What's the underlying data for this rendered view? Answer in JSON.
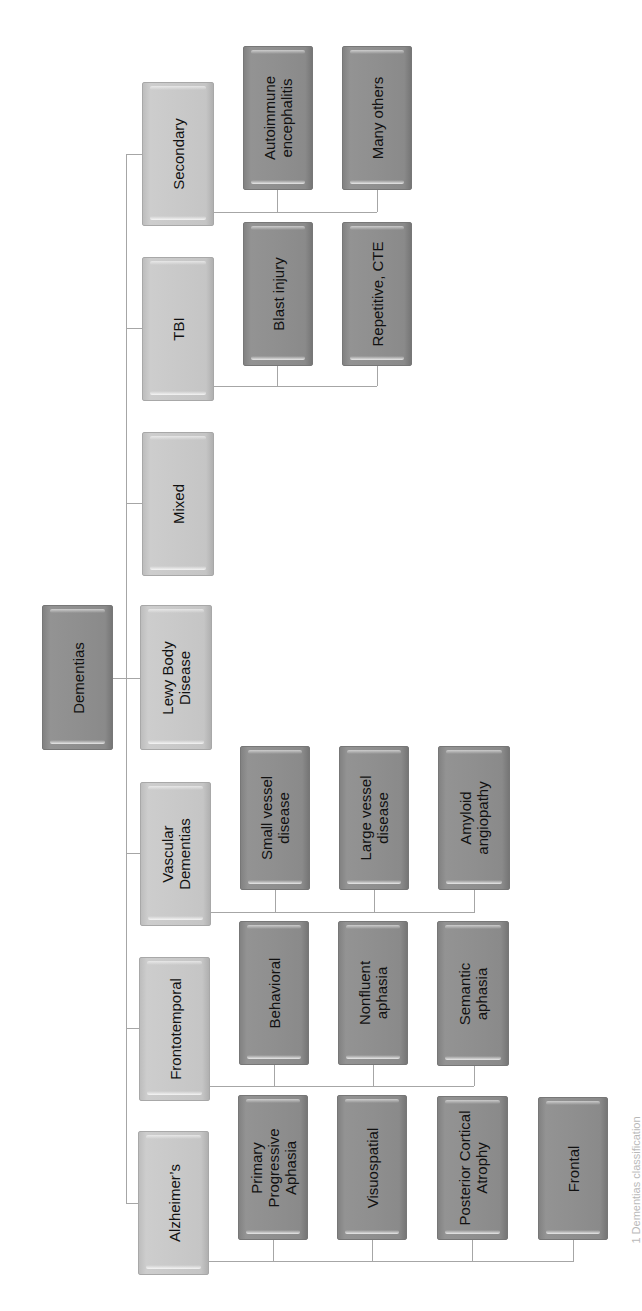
{
  "diagram": {
    "root": {
      "label": "Dementias"
    },
    "categories": [
      {
        "label": "Secondary",
        "children": [
          "Autoimmune\nencephalitis",
          "Many others"
        ]
      },
      {
        "label": "TBI",
        "children": [
          "Blast injury",
          "Repetitive, CTE"
        ]
      },
      {
        "label": "Mixed",
        "children": []
      },
      {
        "label": "Lewy Body\nDisease",
        "children": []
      },
      {
        "label": "Vascular\nDementias",
        "children": [
          "Small vessel\ndisease",
          "Large vessel\ndisease",
          "Amyloid\nangiopathy"
        ]
      },
      {
        "label": "Frontotemporal",
        "children": [
          "Behavioral",
          "Nonfluent\naphasia",
          "Semantic\naphasia"
        ]
      },
      {
        "label": "Alzheimer’s",
        "children": [
          "Primary\nProgressive\nAphasia",
          "Visuospatial",
          "Posterior Cortical\nAtrophy",
          "Frontal"
        ]
      }
    ],
    "caption": "1 Dementias classification"
  },
  "colors": {
    "root_fill": "#8f8f8f",
    "category_fill": "#c9c9c9",
    "subtype_fill": "#8f8f8f",
    "connector": "#a6a6a6"
  }
}
